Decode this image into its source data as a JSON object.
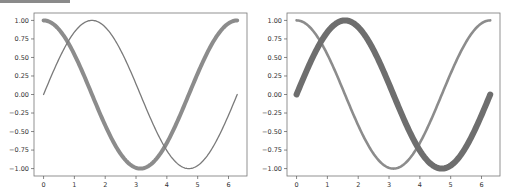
{
  "chart_data": [
    {
      "type": "line",
      "title": "",
      "xlabel": "",
      "ylabel": "",
      "xlim": [
        -0.31,
        6.6
      ],
      "ylim": [
        -1.1,
        1.1
      ],
      "xticks": [
        "0",
        "1",
        "2",
        "3",
        "4",
        "5",
        "6"
      ],
      "yticks": [
        "1.00",
        "0.75",
        "0.50",
        "0.25",
        "0.00",
        "-0.25",
        "-0.50",
        "-0.75",
        "-1.00"
      ],
      "grid": false,
      "legend": null,
      "series": [
        {
          "name": "cos(x)",
          "function": "cos",
          "x_range": [
            0,
            6.283
          ],
          "linewidth": "thick",
          "color": "#8c8c8c"
        },
        {
          "name": "sin(x)",
          "function": "sin",
          "x_range": [
            0,
            6.283
          ],
          "linewidth": "thin",
          "color": "#7a7a7a"
        }
      ]
    },
    {
      "type": "line",
      "title": "",
      "xlabel": "",
      "ylabel": "",
      "xlim": [
        -0.31,
        6.6
      ],
      "ylim": [
        -1.1,
        1.1
      ],
      "xticks": [
        "0",
        "1",
        "2",
        "3",
        "4",
        "5",
        "6"
      ],
      "yticks": [
        "1.00",
        "0.75",
        "0.50",
        "0.25",
        "0.00",
        "-0.25",
        "-0.50",
        "-0.75",
        "-1.00"
      ],
      "grid": false,
      "legend": null,
      "series": [
        {
          "name": "cos(x)",
          "function": "cos",
          "x_range": [
            0,
            6.283
          ],
          "linewidth": "medium",
          "color": "#8c8c8c"
        },
        {
          "name": "sin(x)",
          "function": "sin",
          "x_range": [
            0,
            6.283
          ],
          "linewidth": "thickest",
          "color": "#6e6e6e"
        }
      ]
    }
  ]
}
